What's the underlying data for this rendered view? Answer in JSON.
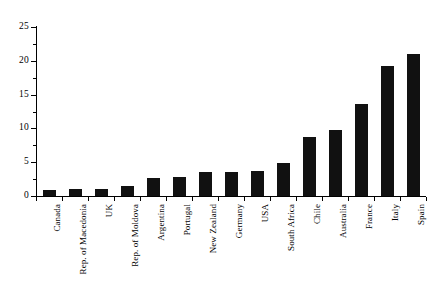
{
  "chart_data": {
    "type": "bar",
    "title": "",
    "subtitle": "",
    "xlabel": "",
    "ylabel": "",
    "ylim": [
      0,
      25
    ],
    "yticks": [
      0,
      5,
      10,
      15,
      20,
      25
    ],
    "ytick_labels": [
      "0",
      "5",
      "10",
      "15",
      "20",
      "25"
    ],
    "grid": false,
    "legend": false,
    "bar_color": "#111111",
    "axis_color": "#000000",
    "background_color": "#ffffff",
    "categories": [
      "Canada",
      "Rep. of Macedonia",
      "UK",
      "Rep. of Moldova",
      "Argentina",
      "Portugal",
      "New Zealand",
      "Germany",
      "USA",
      "South Africa",
      "Chile",
      "Australia",
      "France",
      "Italy",
      "Spain"
    ],
    "values": [
      0.9,
      1.0,
      1.1,
      1.5,
      2.7,
      2.8,
      3.5,
      3.6,
      3.7,
      4.9,
      8.7,
      9.7,
      13.6,
      19.3,
      21.0
    ]
  }
}
